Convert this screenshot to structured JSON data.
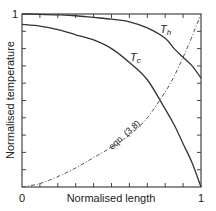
{
  "chart_data": {
    "type": "line",
    "title": "",
    "xlabel": "Normalised length",
    "ylabel": "Normalised temperature",
    "xlim": [
      0,
      1
    ],
    "ylim": [
      0,
      1
    ],
    "x_tick_labels": [
      "0",
      "1"
    ],
    "y_tick_labels": [
      "1"
    ],
    "grid": false,
    "legend": "none (inline curve labels)",
    "x": [
      0,
      0.1,
      0.2,
      0.3,
      0.4,
      0.5,
      0.6,
      0.7,
      0.8,
      0.85,
      0.9,
      0.95,
      1.0
    ],
    "series": [
      {
        "name": "T_h",
        "label": "Th",
        "style": "solid",
        "values": [
          1.0,
          0.998,
          0.995,
          0.99,
          0.98,
          0.97,
          0.955,
          0.92,
          0.86,
          0.8,
          0.75,
          0.7,
          0.63
        ]
      },
      {
        "name": "T_c",
        "label": "Tc",
        "style": "solid",
        "values": [
          0.94,
          0.93,
          0.91,
          0.88,
          0.85,
          0.8,
          0.72,
          0.62,
          0.45,
          0.36,
          0.25,
          0.14,
          0.0
        ]
      },
      {
        "name": "eqn. (3.8)",
        "label": "eqn. (3.8)",
        "style": "dash-dot",
        "values": [
          0.0,
          0.02,
          0.06,
          0.11,
          0.17,
          0.23,
          0.3,
          0.4,
          0.55,
          0.64,
          0.75,
          0.87,
          1.0
        ]
      }
    ],
    "annotations": [
      "T_h",
      "T_c",
      "eqn. (3.8)"
    ]
  },
  "labels": {
    "x_axis": "Normalised length",
    "y_axis": "Normalised temperature",
    "x_min": "0",
    "x_max": "1",
    "y_max": "1",
    "th_main": "T",
    "th_sub": "h",
    "tc_main": "T",
    "tc_sub": "c",
    "eqn": "eqn. (3.8)"
  }
}
